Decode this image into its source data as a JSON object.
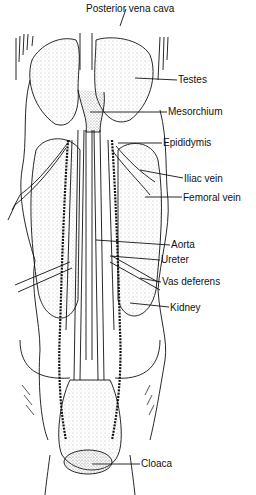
{
  "figure": {
    "labels": [
      {
        "id": "posterior-vena-cava",
        "text": "Posterior vena cava",
        "x": 86,
        "y": 3
      },
      {
        "id": "testes",
        "text": "Testes",
        "x": 178,
        "y": 74
      },
      {
        "id": "mesorchium",
        "text": "Mesorchium",
        "x": 168,
        "y": 106
      },
      {
        "id": "epididymis",
        "text": "Epididymis",
        "x": 163,
        "y": 137
      },
      {
        "id": "iliac-vein",
        "text": "Iliac vein",
        "x": 184,
        "y": 173
      },
      {
        "id": "femoral-vein",
        "text": "Femoral vein",
        "x": 183,
        "y": 192
      },
      {
        "id": "aorta",
        "text": "Aorta",
        "x": 171,
        "y": 239
      },
      {
        "id": "ureter",
        "text": "Ureter",
        "x": 161,
        "y": 254
      },
      {
        "id": "vas-deferens",
        "text": "Vas deferens",
        "x": 162,
        "y": 276
      },
      {
        "id": "kidney",
        "text": "Kidney",
        "x": 170,
        "y": 302
      },
      {
        "id": "cloaca",
        "text": "Cloaca",
        "x": 141,
        "y": 458
      }
    ]
  }
}
